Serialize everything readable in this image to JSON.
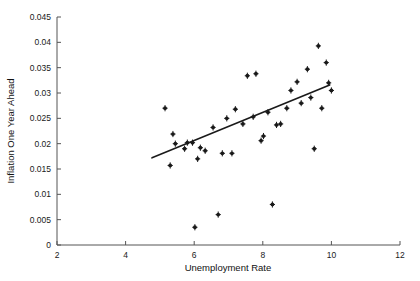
{
  "chart_data": {
    "type": "scatter",
    "title": "",
    "xlabel": "Unemployment Rate",
    "ylabel": "Inflation One Year Ahead",
    "xlim": [
      2,
      12
    ],
    "ylim": [
      0,
      0.045
    ],
    "xticks": [
      2,
      4,
      6,
      8,
      10,
      12
    ],
    "xtick_labels": [
      "2",
      "4",
      "6",
      "8",
      "10",
      "12"
    ],
    "yticks": [
      0,
      0.005,
      0.01,
      0.015,
      0.02,
      0.025,
      0.03,
      0.035,
      0.04,
      0.045
    ],
    "ytick_labels": [
      "0",
      "0.005",
      "0.01",
      "0.015",
      "0.02",
      "0.025",
      "0.03",
      "0.035",
      "0.04",
      "0.045"
    ],
    "grid": false,
    "legend": "none",
    "marker_color": "#1a1a1a",
    "line_color": "#1a1a1a",
    "axis_color": "#555555",
    "points": [
      {
        "x": 5.15,
        "y": 0.027
      },
      {
        "x": 5.3,
        "y": 0.0157
      },
      {
        "x": 5.38,
        "y": 0.0219
      },
      {
        "x": 5.45,
        "y": 0.02
      },
      {
        "x": 5.72,
        "y": 0.019
      },
      {
        "x": 5.8,
        "y": 0.0202
      },
      {
        "x": 5.95,
        "y": 0.0202
      },
      {
        "x": 6.02,
        "y": 0.0035
      },
      {
        "x": 6.1,
        "y": 0.017
      },
      {
        "x": 6.18,
        "y": 0.0192
      },
      {
        "x": 6.32,
        "y": 0.0186
      },
      {
        "x": 6.55,
        "y": 0.0232
      },
      {
        "x": 6.7,
        "y": 0.006
      },
      {
        "x": 6.82,
        "y": 0.0181
      },
      {
        "x": 6.95,
        "y": 0.025
      },
      {
        "x": 7.1,
        "y": 0.0181
      },
      {
        "x": 7.2,
        "y": 0.0268
      },
      {
        "x": 7.42,
        "y": 0.0239
      },
      {
        "x": 7.55,
        "y": 0.0334
      },
      {
        "x": 7.72,
        "y": 0.0253
      },
      {
        "x": 7.8,
        "y": 0.0338
      },
      {
        "x": 7.95,
        "y": 0.0206
      },
      {
        "x": 8.02,
        "y": 0.0215
      },
      {
        "x": 8.15,
        "y": 0.0262
      },
      {
        "x": 8.28,
        "y": 0.008
      },
      {
        "x": 8.4,
        "y": 0.0237
      },
      {
        "x": 8.52,
        "y": 0.0239
      },
      {
        "x": 8.7,
        "y": 0.027
      },
      {
        "x": 8.82,
        "y": 0.0305
      },
      {
        "x": 9.0,
        "y": 0.0322
      },
      {
        "x": 9.12,
        "y": 0.028
      },
      {
        "x": 9.3,
        "y": 0.0347
      },
      {
        "x": 9.4,
        "y": 0.0291
      },
      {
        "x": 9.5,
        "y": 0.019
      },
      {
        "x": 9.62,
        "y": 0.0393
      },
      {
        "x": 9.72,
        "y": 0.027
      },
      {
        "x": 9.85,
        "y": 0.036
      },
      {
        "x": 9.92,
        "y": 0.032
      },
      {
        "x": 10.0,
        "y": 0.0305
      }
    ],
    "fit_line": {
      "x_start": 4.77,
      "y_start": 0.0172,
      "x_end": 9.95,
      "y_end": 0.0316
    }
  }
}
